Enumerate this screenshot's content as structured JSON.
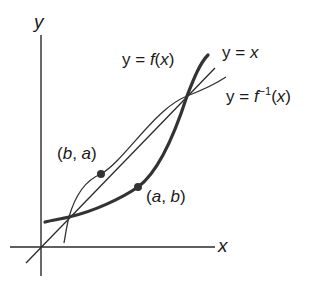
{
  "diagram": {
    "axes": {
      "x_label": "x",
      "y_label": "y"
    },
    "curves": [
      {
        "name": "f",
        "label_prefix": "y = ",
        "label_fn": "f",
        "label_arg": "(x)",
        "style": "thick"
      },
      {
        "name": "identity",
        "label_prefix": "y = ",
        "label_var": "x",
        "style": "thin"
      },
      {
        "name": "f_inverse",
        "label_prefix": "y = ",
        "label_fn": "f",
        "label_sup": "−1",
        "label_arg": "(x)",
        "style": "thin"
      }
    ],
    "points": [
      {
        "name": "point-on-f",
        "label_open": "(",
        "label_a": "a",
        "label_sep": ", ",
        "label_b": "b",
        "label_close": ")"
      },
      {
        "name": "point-on-f-inverse",
        "label_open": "(",
        "label_a": "b",
        "label_sep": ", ",
        "label_b": "a",
        "label_close": ")"
      }
    ],
    "colors": {
      "stroke": "#333333",
      "text": "#1a1a1a",
      "background": "#ffffff"
    }
  }
}
